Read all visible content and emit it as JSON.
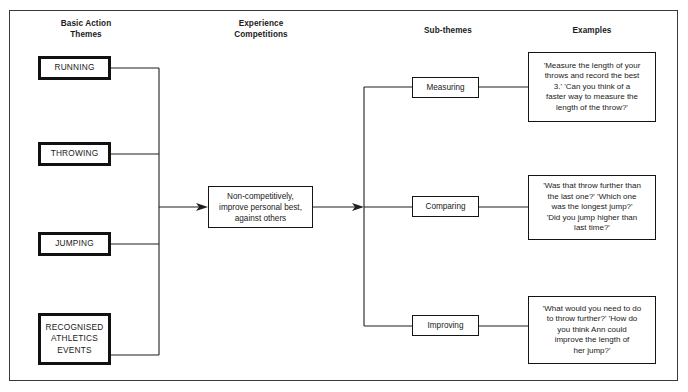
{
  "diagram": {
    "columns": {
      "basic_action_themes": "Basic Action\nThemes",
      "experience_competitions": "Experience\nCompetitions",
      "sub_themes": "Sub-themes",
      "examples": "Examples"
    },
    "themes": [
      {
        "id": "running",
        "label": "RUNNING"
      },
      {
        "id": "throwing",
        "label": "THROWING"
      },
      {
        "id": "jumping",
        "label": "JUMPING"
      },
      {
        "id": "recognised-athletics-events",
        "label": "RECOGNISED\nATHLETICS\nEVENTS"
      }
    ],
    "experience": {
      "label": "Non-competitively,\nimprove personal best,\nagainst others"
    },
    "sub_themes": [
      {
        "id": "measuring",
        "label": "Measuring"
      },
      {
        "id": "comparing",
        "label": "Comparing"
      },
      {
        "id": "improving",
        "label": "Improving"
      }
    ],
    "examples": [
      {
        "id": "measuring",
        "text": "'Measure the length of your\nthrows and record the best\n3.' 'Can you think of a\nfaster way to measure the\nlength of the throw?'"
      },
      {
        "id": "comparing",
        "text": "'Was that throw further than\nthe last one?' 'Which one\nwas the longest jump?'\n'Did you jump higher than\nlast time?'"
      },
      {
        "id": "improving",
        "text": "'What would you need to do\nto throw further?' 'How do\nyou think Ann could\nimprove the length of\nher jump?'"
      }
    ],
    "colors": {
      "ink": "#1a1a1a",
      "line": "#1f1f1f",
      "frame": "#3a3a3a",
      "background": "#ffffff"
    }
  }
}
